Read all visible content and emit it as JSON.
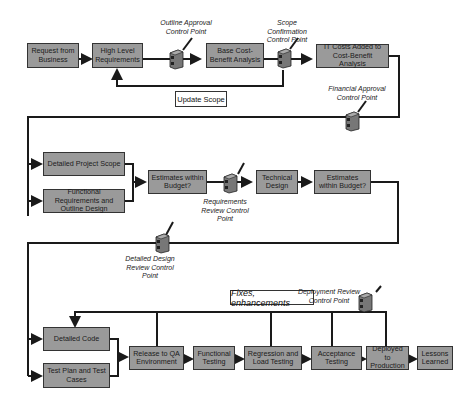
{
  "boxes": {
    "request": "Request from Business",
    "hlr": "High Level Requirements",
    "base_cba": "Base Cost-Benefit Analysis",
    "it_costs": "IT Costs Added to Cost-Benefit Analysis",
    "detailed_scope": "Detailed Project Scope",
    "func_req": "Functional Requirements and Outline Design",
    "est1": "Estimates within Budget?",
    "tech_design": "Technical Design",
    "est2": "Estimates within Budget?",
    "detailed_code": "Detailed Code",
    "test_plan": "Test Plan and Test Cases",
    "release_qa": "Release to QA Environment",
    "func_testing": "Functional Testing",
    "regression": "Regression and Load Testing",
    "acceptance": "Acceptance Testing",
    "deployed": "Deployed to Production",
    "lessons": "Lessons Learned"
  },
  "notes": {
    "update_scope": "Update Scope",
    "fixes": "Fixes, enhancements"
  },
  "control_points": {
    "outline": "Outline Approval Control Point",
    "scope": "Scope Confirmation Control Point",
    "financial": "Financial Approval Control Point",
    "requirements": "Requirements Review Control Point",
    "detailed_design": "Detailed Design Review Control Point",
    "deployment": "Deployment Review Control Point"
  },
  "colors": {
    "box_fill": "#9a9a9a",
    "line": "#1a1a1a"
  }
}
